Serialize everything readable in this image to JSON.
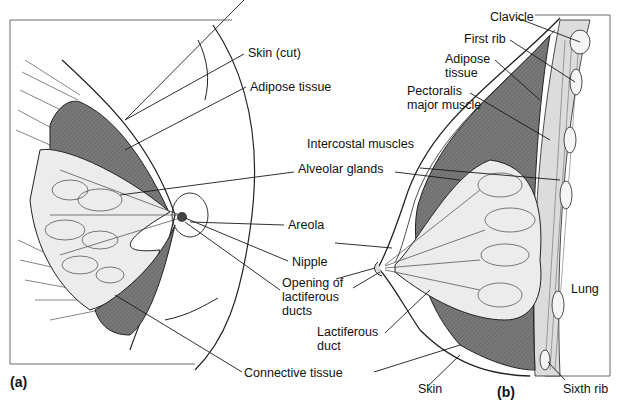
{
  "figure": {
    "panels": [
      {
        "id": "a",
        "label": "(a)",
        "view": "anterior view, partially dissected"
      },
      {
        "id": "b",
        "label": "(b)",
        "view": "sagittal section"
      }
    ],
    "labels": {
      "skin_cut": "Skin (cut)",
      "adipose_tissue": "Adipose tissue",
      "alveolar_glands": "Alveolar glands",
      "areola": "Areola",
      "nipple": "Nipple",
      "opening_ducts_1": "Opening of",
      "opening_ducts_2": "lactiferous",
      "opening_ducts_3": "ducts",
      "connective_tissue": "Connective tissue",
      "clavicle": "Clavicle",
      "first_rib": "First rib",
      "adipose_b_1": "Adipose",
      "adipose_b_2": "tissue",
      "pectoralis_1": "Pectoralis",
      "pectoralis_2": "major muscle",
      "intercostal": "Intercostal muscles",
      "lactiferous_duct_1": "Lactiferous",
      "lactiferous_duct_2": "duct",
      "lung": "Lung",
      "skin": "Skin",
      "sixth_rib": "Sixth rib"
    },
    "colors": {
      "adipose_fill": "#6e6e6e",
      "gland_fill": "#ececec",
      "line": "#1a1a1a"
    }
  }
}
